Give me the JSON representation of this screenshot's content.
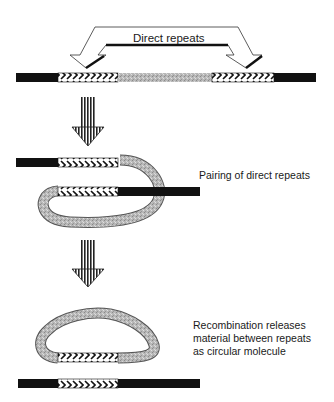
{
  "diagram": {
    "labels": {
      "direct_repeats": "Direct repeats",
      "pairing": "Pairing of direct repeats",
      "recombination_line1": "Recombination releases",
      "recombination_line2": "material between repeats",
      "recombination_line3": "as circular molecule"
    },
    "steps": [
      {
        "name": "linear-dna-with-direct-repeats",
        "caption": "Direct repeats"
      },
      {
        "name": "paired-loop",
        "caption": "Pairing of direct repeats"
      },
      {
        "name": "circle-excision",
        "caption": "Recombination releases material between repeats as circular molecule"
      }
    ],
    "colors": {
      "flank": "#111111",
      "intervening": "#b5b5b5",
      "repeat_fill": "#ffffff",
      "repeat_chevron": "#111111",
      "arrow": "#222222"
    }
  }
}
